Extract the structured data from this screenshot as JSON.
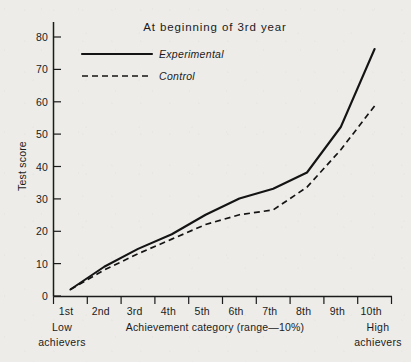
{
  "chart_data": {
    "type": "line",
    "title": "At beginning of 3rd year",
    "xlabel": "Achievement category (range—10%)",
    "ylabel": "Test score",
    "categories": [
      "1st",
      "2nd",
      "3rd",
      "4th",
      "5th",
      "6th",
      "7th",
      "8th",
      "9th",
      "10th"
    ],
    "yticks": [
      0,
      10,
      20,
      30,
      40,
      50,
      60,
      70,
      80
    ],
    "ylim": [
      0,
      84
    ],
    "grid": false,
    "legend_position": "top-left",
    "x_axis_end_labels": {
      "left_line1": "Low",
      "left_line2": "achievers",
      "right_line1": "High",
      "right_line2": "achievers"
    },
    "series": [
      {
        "name": "Experimental",
        "style": "solid",
        "color": "#141414",
        "values": [
          2,
          9,
          14.5,
          19,
          25,
          30,
          33,
          38,
          52,
          76
        ]
      },
      {
        "name": "Control",
        "style": "dashed",
        "color": "#141414",
        "values": [
          2,
          8,
          13,
          17.5,
          22,
          25,
          26.5,
          33.5,
          45,
          58.5
        ]
      }
    ]
  },
  "legend": {
    "items": [
      {
        "label": "Experimental",
        "style": "solid"
      },
      {
        "label": "Control",
        "style": "dashed"
      }
    ]
  },
  "ytick_labels": [
    "80",
    "70",
    "60",
    "50",
    "40",
    "30",
    "20",
    "10",
    "0"
  ],
  "colors": {
    "background": "#edece9",
    "ink": "#1b1b1b",
    "series": "#141414"
  }
}
